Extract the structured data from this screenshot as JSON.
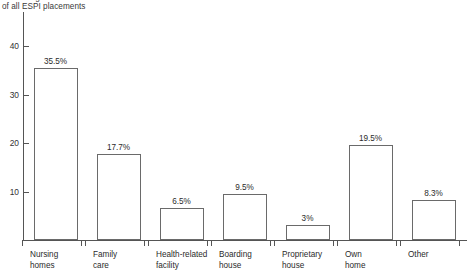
{
  "axis_caption": {
    "line1": "Percentage",
    "line2": "of all ESPI placements"
  },
  "y_axis": {
    "ticks": [
      "40",
      "30",
      "20",
      "10"
    ]
  },
  "chart_data": {
    "type": "bar",
    "title": "",
    "xlabel": "",
    "ylabel": "Percentage of all ESPI placements",
    "ylim": [
      0,
      44
    ],
    "yticks": [
      10,
      20,
      30,
      40
    ],
    "grid": false,
    "legend": false,
    "categories": [
      "Nursing homes",
      "Family care",
      "Health-related facility",
      "Boarding house",
      "Proprietary house",
      "Own home",
      "Other"
    ],
    "category_lines": [
      [
        "Nursing",
        "homes"
      ],
      [
        "Family",
        "care"
      ],
      [
        "Health-related",
        "facility"
      ],
      [
        "Boarding",
        "house"
      ],
      [
        "Proprietary",
        "house"
      ],
      [
        "Own",
        "home"
      ],
      [
        "Other"
      ]
    ],
    "values": [
      35.5,
      17.7,
      6.5,
      9.5,
      3,
      19.5,
      8.3
    ],
    "value_labels": [
      "35.5%",
      "17.7%",
      "6.5%",
      "9.5%",
      "3%",
      "19.5%",
      "8.3%"
    ]
  }
}
